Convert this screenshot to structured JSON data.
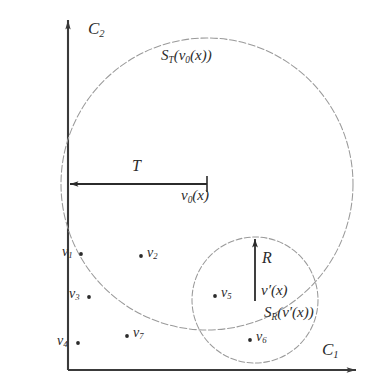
{
  "figure": {
    "type": "diagram",
    "background_color": "#ffffff",
    "ink_color": "#2b2b2b",
    "curve_color": "#8a8a8a",
    "axes": {
      "x_axis_label": "C",
      "x_axis_sub": "1",
      "y_axis_label": "C",
      "y_axis_sub": "2",
      "origin_px": [
        68,
        370
      ],
      "x_axis_end_px": [
        358,
        370
      ],
      "y_axis_top_px": [
        68,
        18
      ]
    },
    "circles": [
      {
        "name": "large-ball",
        "label_main": "S",
        "label_sub": "T",
        "label_arg": "(v",
        "label_arg_sub": "0",
        "label_arg_tail": "(x))",
        "center_px": [
          207,
          184
        ],
        "radius_px": 146,
        "label_px": [
          160,
          48
        ],
        "style": "dashed"
      },
      {
        "name": "small-ball",
        "label_main": "S",
        "label_sub": "R",
        "label_arg": "(v′(x))",
        "center_px": [
          255,
          300
        ],
        "radius_px": 63,
        "label_px": [
          263,
          305
        ],
        "style": "dashed"
      }
    ],
    "arrows": [
      {
        "name": "radius-T-arrow",
        "label": "T",
        "label_px": [
          133,
          160
        ],
        "endpoint_label": "v",
        "endpoint_label_sub": "0",
        "endpoint_label_tail": "(x)",
        "endpoint_label_px": [
          182,
          188
        ],
        "from_px": [
          68,
          184
        ],
        "to_px": [
          207,
          184
        ],
        "direction": "left",
        "orientation": "horizontal"
      },
      {
        "name": "radius-R-arrow",
        "label": "R",
        "label_px": [
          261,
          251
        ],
        "endpoint_label": "v′(x)",
        "endpoint_label_px": [
          261,
          284
        ],
        "from_px": [
          255,
          300
        ],
        "to_px": [
          255,
          237
        ],
        "direction": "up",
        "orientation": "vertical"
      }
    ],
    "points": [
      {
        "name": "v1",
        "label": "v",
        "sub": "1",
        "dot_px": [
          81,
          254
        ],
        "label_px": [
          63,
          244
        ],
        "dot_side": "right"
      },
      {
        "name": "v2",
        "label": "v",
        "sub": "2",
        "dot_px": [
          141,
          256
        ],
        "label_px": [
          147,
          245
        ],
        "dot_side": "left"
      },
      {
        "name": "v3",
        "label": "v",
        "sub": "3",
        "dot_px": [
          89,
          297
        ],
        "label_px": [
          69,
          286
        ],
        "dot_side": "right"
      },
      {
        "name": "v4",
        "label": "v",
        "sub": "4",
        "dot_px": [
          78,
          343
        ],
        "label_px": [
          58,
          333
        ],
        "dot_side": "right"
      },
      {
        "name": "v5",
        "label": "v",
        "sub": "5",
        "dot_px": [
          215,
          296
        ],
        "label_px": [
          221,
          285
        ],
        "dot_side": "left"
      },
      {
        "name": "v6",
        "label": "v",
        "sub": "6",
        "dot_px": [
          250,
          340
        ],
        "label_px": [
          256,
          329
        ],
        "dot_side": "left"
      },
      {
        "name": "v7",
        "label": "v",
        "sub": "7",
        "dot_px": [
          127,
          336
        ],
        "label_px": [
          133,
          325
        ],
        "dot_side": "left"
      }
    ]
  }
}
